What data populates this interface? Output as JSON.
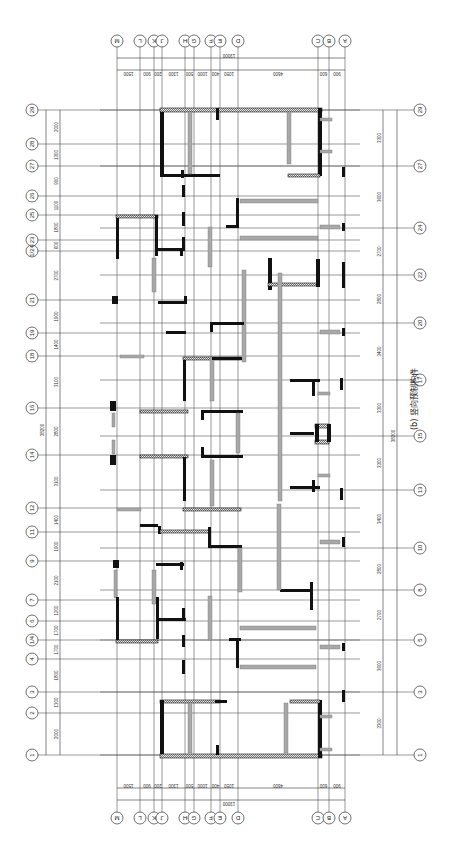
{
  "figure": {
    "caption": "(b) 竖向预制构件",
    "orientation": "rotated 90° (plan drawn sideways)",
    "colors": {
      "grid": "#555555",
      "cast_in_place_wall": "#111111",
      "precast_component": "#a8a8a8",
      "background": "#ffffff"
    }
  },
  "column_axes": {
    "labels": [
      "M",
      "L",
      "K",
      "J",
      "H",
      "G",
      "F",
      "E",
      "D",
      "C",
      "B",
      "A"
    ],
    "x_positions": [
      117,
      140,
      154,
      162,
      185,
      194,
      211,
      220,
      238,
      318,
      329,
      345
    ],
    "segment_dims": [
      "1500",
      "900",
      "200",
      "1300",
      "500",
      "1000",
      "400",
      "1050",
      "4600",
      "600",
      "900"
    ],
    "total_dim": "13000"
  },
  "row_axes_left": {
    "labels": [
      "29",
      "28",
      "27",
      "26",
      "25",
      "23",
      "(1/24)",
      "21",
      "19",
      "18",
      "16",
      "14",
      "12",
      "11",
      "9",
      "7",
      "6",
      "(1/4)",
      "4",
      "3",
      "2",
      "1"
    ],
    "y_positions": [
      110,
      144,
      166,
      196,
      215,
      240,
      251,
      300,
      333,
      356,
      408,
      455,
      508,
      532,
      561,
      600,
      621,
      640,
      659,
      692,
      713,
      755
    ],
    "segment_dims": [
      "2000",
      "1300",
      "900",
      "1100",
      "1800",
      "600",
      "2700",
      "1900",
      "1400",
      "3100",
      "2800",
      "3100",
      "1400",
      "1900",
      "2100",
      "1200",
      "1700",
      "1700",
      "1800",
      "1300",
      "2000"
    ],
    "total_dim": "38200"
  },
  "row_axes_right": {
    "labels": [
      "29",
      "27",
      "24",
      "22",
      "20",
      "17",
      "15",
      "13",
      "10",
      "8",
      "5",
      "3",
      "1"
    ],
    "y_positions": [
      110,
      166,
      228,
      275,
      323,
      380,
      436,
      490,
      548,
      590,
      640,
      692,
      755
    ],
    "segment_dims": [
      "3300",
      "3600",
      "2700",
      "2800",
      "3400",
      "3300",
      "3300",
      "3400",
      "2800",
      "2700",
      "3600",
      "3300"
    ],
    "total_dim": "38200"
  },
  "legend_notes": {
    "black_bars": "cast-in-place walls",
    "gray_bars": "vertical precast components",
    "hatched_bars": "precast walls with hatching"
  }
}
